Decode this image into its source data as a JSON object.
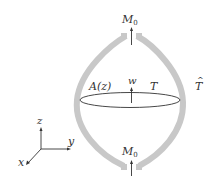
{
  "diagram": {
    "labels": {
      "moment_top": "M",
      "moment_top_sub": "0",
      "moment_bottom": "M",
      "moment_bottom_sub": "0",
      "area": "A(z)",
      "velocity": "w",
      "tension_inner": "T",
      "tension_outer": "T",
      "tension_outer_accent": "^"
    },
    "axes": {
      "z": "z",
      "y": "y",
      "x": "x"
    },
    "colors": {
      "membrane": "#c8c8c8",
      "lines": "#333333",
      "background": "#ffffff"
    }
  }
}
